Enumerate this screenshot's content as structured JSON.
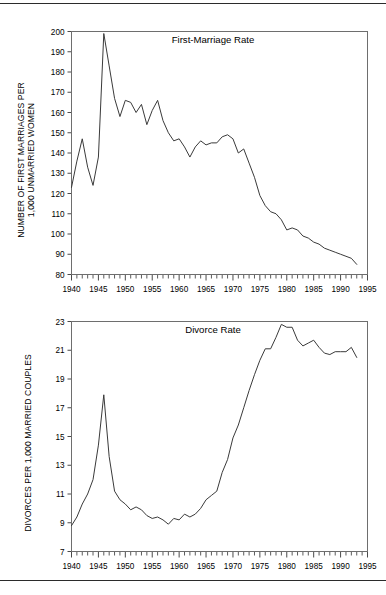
{
  "figure": {
    "background": "#ffffff",
    "line_color": "#3a3a3a",
    "axis_color": "#6e6e6e",
    "rule_color": "#2b2b2b"
  },
  "chart_data": [
    {
      "type": "line",
      "id": "first-marriage-rate",
      "title": "First-Marriage Rate",
      "xlabel": "",
      "ylabel": "NUMBER OF FIRST MARRIAGES PER 1,000 UNMARRIED WOMEN",
      "ylabel_line1": "NUMBER OF FIRST MARRIAGES PER",
      "ylabel_line2": "1,000 UNMARRIED WOMEN",
      "xlim": [
        1940,
        1995
      ],
      "ylim": [
        80,
        200
      ],
      "xticks": [
        1940,
        1945,
        1950,
        1955,
        1960,
        1965,
        1970,
        1975,
        1980,
        1985,
        1990,
        1995
      ],
      "xtick_labels": [
        "1940",
        "1945",
        "1950",
        "1955",
        "1960",
        "1965",
        "1970",
        "1975",
        "1980",
        "1985",
        "1990",
        "1995"
      ],
      "xtick_minor_step": 1,
      "yticks": [
        80,
        90,
        100,
        110,
        120,
        130,
        140,
        150,
        160,
        170,
        180,
        190,
        200
      ],
      "ytick_labels": [
        "80",
        "90",
        "100",
        "110",
        "120",
        "130",
        "140",
        "150",
        "160",
        "170",
        "180",
        "190",
        "200"
      ],
      "grid": false,
      "legend": "none",
      "x": [
        1940,
        1941,
        1942,
        1943,
        1944,
        1945,
        1946,
        1947,
        1948,
        1949,
        1950,
        1951,
        1952,
        1953,
        1954,
        1955,
        1956,
        1957,
        1958,
        1959,
        1960,
        1961,
        1962,
        1963,
        1964,
        1965,
        1966,
        1967,
        1968,
        1969,
        1970,
        1971,
        1972,
        1973,
        1974,
        1975,
        1976,
        1977,
        1978,
        1979,
        1980,
        1981,
        1982,
        1983,
        1984,
        1985,
        1986,
        1987,
        1988,
        1989,
        1990,
        1991,
        1992,
        1993
      ],
      "y": [
        123,
        136,
        147,
        133,
        124,
        138,
        199,
        183,
        167,
        158,
        166,
        165,
        160,
        164,
        154,
        161,
        166,
        156,
        150,
        146,
        147,
        143,
        138,
        143,
        146,
        144,
        145,
        145,
        148,
        149,
        147,
        140,
        142,
        135,
        128,
        119,
        114,
        111,
        110,
        107,
        102,
        103,
        102,
        99,
        98,
        96,
        95,
        93,
        92,
        91,
        90,
        89,
        88,
        85
      ],
      "annotations": []
    },
    {
      "type": "line",
      "id": "divorce-rate",
      "title": "Divorce Rate",
      "xlabel": "",
      "ylabel": "DIVORCES PER 1,000 MARRIED COUPLES",
      "xlim": [
        1940,
        1995
      ],
      "ylim": [
        7,
        23
      ],
      "xticks": [
        1940,
        1945,
        1950,
        1955,
        1960,
        1965,
        1970,
        1975,
        1980,
        1985,
        1990,
        1995
      ],
      "xtick_labels": [
        "1940",
        "1945",
        "1950",
        "1955",
        "1960",
        "1965",
        "1970",
        "1975",
        "1980",
        "1985",
        "1990",
        "1995"
      ],
      "xtick_minor_step": 1,
      "yticks": [
        7,
        9,
        11,
        13,
        15,
        17,
        19,
        21,
        23
      ],
      "ytick_labels": [
        "7",
        "9",
        "11",
        "13",
        "15",
        "17",
        "19",
        "21",
        "23"
      ],
      "grid": false,
      "legend": "none",
      "x": [
        1940,
        1941,
        1942,
        1943,
        1944,
        1945,
        1946,
        1947,
        1948,
        1949,
        1950,
        1951,
        1952,
        1953,
        1954,
        1955,
        1956,
        1957,
        1958,
        1959,
        1960,
        1961,
        1962,
        1963,
        1964,
        1965,
        1966,
        1967,
        1968,
        1969,
        1970,
        1971,
        1972,
        1973,
        1974,
        1975,
        1976,
        1977,
        1978,
        1979,
        1980,
        1981,
        1982,
        1983,
        1984,
        1985,
        1986,
        1987,
        1988,
        1989,
        1990,
        1991,
        1992,
        1993
      ],
      "y": [
        8.8,
        9.4,
        10.3,
        11.0,
        12.0,
        14.4,
        17.9,
        13.6,
        11.2,
        10.6,
        10.3,
        9.9,
        10.1,
        9.9,
        9.5,
        9.3,
        9.4,
        9.2,
        8.9,
        9.3,
        9.2,
        9.6,
        9.4,
        9.6,
        10.0,
        10.6,
        10.9,
        11.2,
        12.5,
        13.4,
        14.9,
        15.8,
        17.0,
        18.2,
        19.3,
        20.3,
        21.1,
        21.1,
        21.9,
        22.8,
        22.6,
        22.6,
        21.7,
        21.3,
        21.5,
        21.7,
        21.2,
        20.8,
        20.7,
        20.9,
        20.9,
        20.9,
        21.2,
        20.5
      ],
      "annotations": []
    }
  ]
}
